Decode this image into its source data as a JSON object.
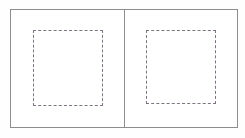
{
  "figure": {
    "background_color": "#ffffff",
    "frame_color": "#8d8d8d",
    "dash_color": "#7d7480",
    "width": 245,
    "height": 138
  },
  "outer_frame": {
    "name": "outer-border",
    "label": "",
    "x": 10,
    "y": 9,
    "width": 228,
    "height": 119,
    "border_style": "solid",
    "border_width_px": 1,
    "color": "#8d8d8d"
  },
  "divider": {
    "name": "vertical-divider",
    "label": "",
    "orientation": "vertical",
    "x": 124,
    "color": "#8d8d8d",
    "width_px": 1
  },
  "panels": [
    {
      "name": "left-panel",
      "label": "",
      "index": 1,
      "x": 11,
      "y": 10,
      "width": 114,
      "height": 117,
      "dashed_region": {
        "name": "left-dashed-region",
        "label": "",
        "x": 33,
        "y": 30,
        "width": 70,
        "height": 76,
        "border_style": "dashed",
        "color": "#7d7480"
      }
    },
    {
      "name": "right-panel",
      "label": "",
      "index": 2,
      "x": 125,
      "y": 10,
      "width": 113,
      "height": 117,
      "dashed_region": {
        "name": "right-dashed-region",
        "label": "",
        "x": 146,
        "y": 30,
        "width": 70,
        "height": 74,
        "border_style": "dashed",
        "color": "#7d7480"
      }
    }
  ]
}
